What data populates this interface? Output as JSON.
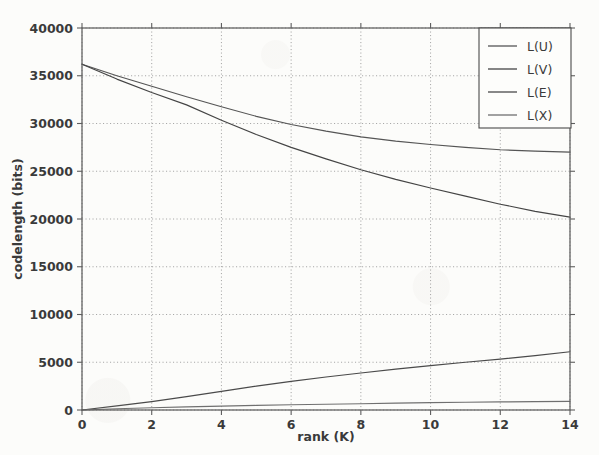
{
  "chart_data": {
    "type": "line",
    "title": "",
    "xlabel": "rank (K)",
    "ylabel": "codelength (bits)",
    "xlim": [
      0,
      14
    ],
    "ylim": [
      0,
      40000
    ],
    "xticks": [
      "0",
      "2",
      "4",
      "6",
      "8",
      "10",
      "12",
      "14"
    ],
    "xtick_values": [
      0,
      2,
      4,
      6,
      8,
      10,
      12,
      14
    ],
    "yticks": [
      "0",
      "5000",
      "10000",
      "15000",
      "20000",
      "25000",
      "30000",
      "35000",
      "40000"
    ],
    "ytick_values": [
      0,
      5000,
      10000,
      15000,
      20000,
      25000,
      30000,
      35000,
      40000
    ],
    "grid": true,
    "grid_style": "dotted",
    "legend_position": "upper right",
    "x": [
      0,
      1,
      2,
      3,
      4,
      5,
      6,
      7,
      8,
      9,
      10,
      11,
      12,
      13,
      14
    ],
    "series": [
      {
        "name": "L(U)",
        "color": "#555555",
        "values": [
          36200,
          35000,
          33900,
          32800,
          31750,
          30750,
          29900,
          29200,
          28600,
          28150,
          27800,
          27500,
          27250,
          27100,
          27000
        ]
      },
      {
        "name": "L(V)",
        "color": "#444444",
        "values": [
          36200,
          34650,
          33250,
          31950,
          30350,
          28850,
          27500,
          26300,
          25150,
          24150,
          23250,
          22400,
          21550,
          20800,
          20200
        ]
      },
      {
        "name": "L(E)",
        "color": "#4a4a4a",
        "values": [
          0,
          430,
          880,
          1400,
          1950,
          2500,
          3000,
          3450,
          3880,
          4280,
          4650,
          5000,
          5320,
          5700,
          6100
        ]
      },
      {
        "name": "L(X)",
        "color": "#707070",
        "values": [
          0,
          130,
          240,
          330,
          410,
          480,
          545,
          605,
          660,
          715,
          765,
          810,
          850,
          880,
          905
        ]
      }
    ]
  },
  "legend": {
    "entries": [
      {
        "label": "L(U)"
      },
      {
        "label": "L(V)"
      },
      {
        "label": "L(E)"
      },
      {
        "label": "L(X)"
      }
    ]
  },
  "axes": {
    "x_title": "rank (K)",
    "y_title": "codelength (bits)"
  }
}
